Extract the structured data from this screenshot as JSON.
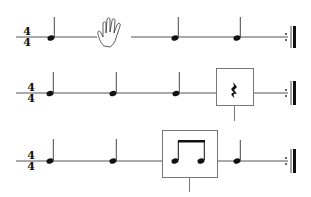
{
  "colors": {
    "ink": "#111111",
    "staff": "#555555",
    "box": "#777777",
    "background": "#ffffff"
  },
  "rows": [
    {
      "time_signature": {
        "top": "4",
        "bottom": "4"
      },
      "beats": [
        "quarter-note",
        "hand-icon (rest / clap)",
        "quarter-note",
        "quarter-note"
      ],
      "ending": "repeat-end-barline"
    },
    {
      "time_signature": {
        "top": "4",
        "bottom": "4"
      },
      "beats": [
        "quarter-note",
        "quarter-note",
        "quarter-note",
        "quarter-rest (boxed)"
      ],
      "ending": "repeat-end-barline"
    },
    {
      "time_signature": {
        "top": "4",
        "bottom": "4"
      },
      "beats": [
        "quarter-note",
        "quarter-note",
        "two-eighth-notes (boxed)",
        "quarter-note"
      ],
      "ending": "repeat-end-barline"
    }
  ]
}
